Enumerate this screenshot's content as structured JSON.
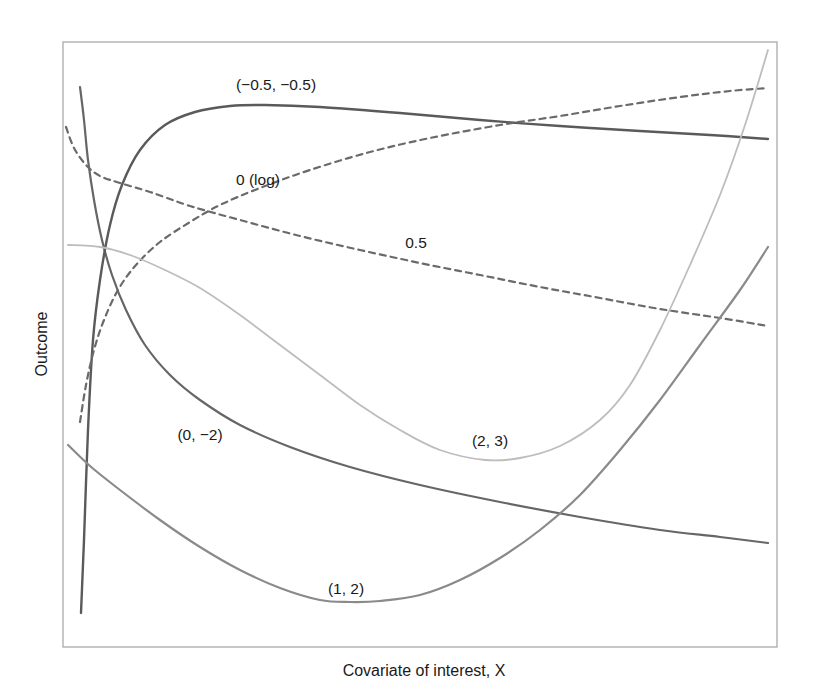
{
  "chart_data": {
    "type": "line",
    "title": "",
    "xlabel": "Covariate of interest, X",
    "ylabel": "Outcome",
    "grid": false,
    "legend": "none (curves labeled inline)",
    "axis_ticks": "none",
    "x_range_px": [
      63,
      777
    ],
    "y_range_px": [
      42,
      647
    ],
    "series": [
      {
        "name": "(0, −2)",
        "label": "(0, −2)",
        "style": "solid",
        "color": "#666666",
        "width": 2.2,
        "points_px": [
          [
            80,
            87
          ],
          [
            84,
            120
          ],
          [
            88,
            160
          ],
          [
            94,
            200
          ],
          [
            102,
            240
          ],
          [
            112,
            275
          ],
          [
            126,
            310
          ],
          [
            145,
            345
          ],
          [
            170,
            375
          ],
          [
            200,
            400
          ],
          [
            240,
            425
          ],
          [
            290,
            447
          ],
          [
            350,
            467
          ],
          [
            420,
            485
          ],
          [
            500,
            502
          ],
          [
            580,
            517
          ],
          [
            660,
            530
          ],
          [
            720,
            537
          ],
          [
            768,
            543
          ]
        ]
      },
      {
        "name": "(−0.5, −0.5)",
        "label": "(−0.5, −0.5)",
        "style": "solid",
        "color": "#5a5a5a",
        "width": 2.4,
        "points_px": [
          [
            81,
            613
          ],
          [
            84,
            540
          ],
          [
            88,
            430
          ],
          [
            93,
            340
          ],
          [
            100,
            280
          ],
          [
            110,
            225
          ],
          [
            122,
            185
          ],
          [
            140,
            150
          ],
          [
            165,
            125
          ],
          [
            195,
            112
          ],
          [
            230,
            106
          ],
          [
            265,
            105
          ],
          [
            320,
            107
          ],
          [
            400,
            113
          ],
          [
            480,
            120
          ],
          [
            560,
            126
          ],
          [
            640,
            131
          ],
          [
            710,
            135
          ],
          [
            768,
            139
          ]
        ]
      },
      {
        "name": "0 (log)",
        "label": "0 (log)",
        "style": "dashed",
        "color": "#6a6a6a",
        "width": 2.2,
        "points_px": [
          [
            80,
            422
          ],
          [
            86,
            385
          ],
          [
            94,
            350
          ],
          [
            104,
            320
          ],
          [
            118,
            290
          ],
          [
            136,
            265
          ],
          [
            160,
            242
          ],
          [
            190,
            222
          ],
          [
            220,
            205
          ],
          [
            260,
            188
          ],
          [
            310,
            170
          ],
          [
            370,
            152
          ],
          [
            430,
            138
          ],
          [
            500,
            125
          ],
          [
            560,
            116
          ],
          [
            620,
            106
          ],
          [
            680,
            97
          ],
          [
            730,
            91
          ],
          [
            768,
            88
          ]
        ]
      },
      {
        "name": "0.5",
        "label": "0.5",
        "style": "dashed",
        "color": "#6a6a6a",
        "width": 2.2,
        "points_px": [
          [
            66,
            127
          ],
          [
            74,
            148
          ],
          [
            86,
            165
          ],
          [
            100,
            176
          ],
          [
            120,
            183
          ],
          [
            150,
            192
          ],
          [
            190,
            206
          ],
          [
            240,
            220
          ],
          [
            300,
            236
          ],
          [
            360,
            250
          ],
          [
            420,
            263
          ],
          [
            480,
            275
          ],
          [
            540,
            287
          ],
          [
            600,
            298
          ],
          [
            660,
            309
          ],
          [
            720,
            318
          ],
          [
            768,
            326
          ]
        ]
      },
      {
        "name": "(2, 3)",
        "label": "(2, 3)",
        "style": "solid",
        "color": "#bdbdbd",
        "width": 1.8,
        "points_px": [
          [
            68,
            245
          ],
          [
            100,
            247
          ],
          [
            130,
            255
          ],
          [
            165,
            270
          ],
          [
            200,
            288
          ],
          [
            240,
            315
          ],
          [
            280,
            345
          ],
          [
            320,
            375
          ],
          [
            360,
            405
          ],
          [
            400,
            430
          ],
          [
            440,
            450
          ],
          [
            485,
            460
          ],
          [
            520,
            458
          ],
          [
            560,
            446
          ],
          [
            600,
            420
          ],
          [
            630,
            385
          ],
          [
            660,
            330
          ],
          [
            690,
            265
          ],
          [
            720,
            195
          ],
          [
            745,
            125
          ],
          [
            768,
            50
          ]
        ]
      },
      {
        "name": "(1, 2)",
        "label": "(1, 2)",
        "style": "solid",
        "color": "#8a8a8a",
        "width": 2.2,
        "points_px": [
          [
            68,
            445
          ],
          [
            90,
            466
          ],
          [
            120,
            490
          ],
          [
            160,
            520
          ],
          [
            200,
            547
          ],
          [
            240,
            570
          ],
          [
            280,
            588
          ],
          [
            320,
            600
          ],
          [
            350,
            602
          ],
          [
            380,
            601
          ],
          [
            420,
            595
          ],
          [
            460,
            580
          ],
          [
            500,
            558
          ],
          [
            540,
            530
          ],
          [
            580,
            495
          ],
          [
            620,
            450
          ],
          [
            660,
            400
          ],
          [
            700,
            345
          ],
          [
            740,
            290
          ],
          [
            768,
            247
          ]
        ]
      }
    ],
    "annotations": [
      {
        "text": "(−0.5, −0.5)",
        "x_px": 276,
        "y_px": 90
      },
      {
        "text": "0 (log)",
        "x_px": 258,
        "y_px": 185
      },
      {
        "text": "0.5",
        "x_px": 416,
        "y_px": 248
      },
      {
        "text": "(0, −2)",
        "x_px": 200,
        "y_px": 440
      },
      {
        "text": "(2, 3)",
        "x_px": 490,
        "y_px": 446
      },
      {
        "text": "(1, 2)",
        "x_px": 346,
        "y_px": 594
      }
    ]
  },
  "plot": {
    "frame": {
      "left": 63,
      "top": 42,
      "right": 777,
      "bottom": 647,
      "color": "#a9a9a9"
    }
  },
  "axes": {
    "x_label": "Covariate of interest, X",
    "y_label": "Outcome"
  },
  "labels": {
    "neg05_neg05": "(−0.5, −0.5)",
    "log0": "0 (log)",
    "half": "0.5",
    "zero_neg2": "(0, −2)",
    "two_three": "(2, 3)",
    "one_two": "(1, 2)"
  }
}
